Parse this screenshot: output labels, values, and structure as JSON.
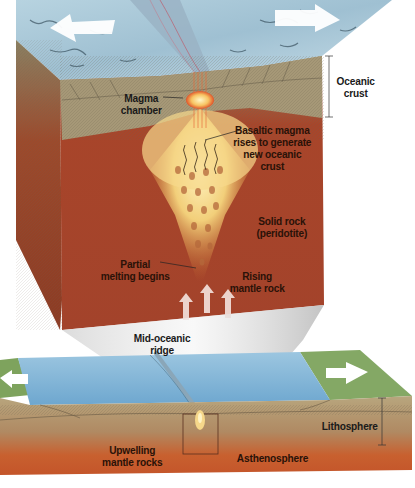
{
  "diagram": {
    "colors": {
      "ocean_surface": "#a9c8d8",
      "crust": "#a89a78",
      "mantle": "#a8452a",
      "magma": "#f4d27a",
      "water": "#7fb3d6",
      "land": "#6f9a55",
      "asthenosphere": "#c8562b"
    },
    "labels": {
      "oceanic_crust": "Oceanic\ncrust",
      "magma_chamber": "Magma\nchamber",
      "basaltic_magma": "Basaltic magma\nrises to generate\nnew oceanic\ncrust",
      "solid_rock": "Solid rock\n(peridotite)",
      "partial_melting": "Partial\nmelting begins",
      "rising_mantle": "Rising\nmantle rock",
      "mid_oceanic_ridge": "Mid-oceanic\nridge",
      "lithosphere": "Lithosphere",
      "upwelling": "Upwelling\nmantle rocks",
      "asthenosphere": "Asthenosphere"
    },
    "arrows": {
      "top_left": "spreading-left",
      "top_right": "spreading-right",
      "bottom_left": "spreading-left",
      "bottom_right": "spreading-right",
      "mantle_up_count": 3
    }
  }
}
